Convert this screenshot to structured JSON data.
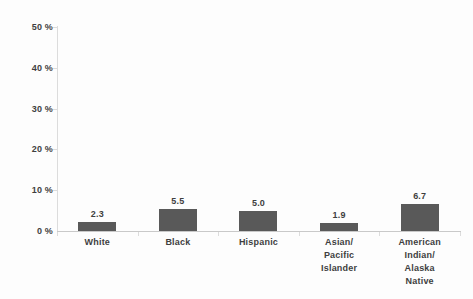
{
  "chart_data": {
    "type": "bar",
    "title": "",
    "subtitle": "",
    "xlabel": "",
    "ylabel": "",
    "categories": [
      "White",
      "Black",
      "Hispanic",
      "Asian/\nPacific\nIslander",
      "American\nIndian/\nAlaska\nNative"
    ],
    "values": [
      2.3,
      5.5,
      5.0,
      1.9,
      6.7
    ],
    "data_labels": [
      "2.3",
      "5.5",
      "5.0",
      "1.9",
      "6.7"
    ],
    "ylim": [
      0,
      50
    ],
    "ytick_values": [
      0,
      10,
      20,
      30,
      40,
      50
    ],
    "ytick_labels": [
      "0 %",
      "10 %",
      "20 %",
      "30 %",
      "40 %",
      "50 %"
    ],
    "grid": false,
    "legend": false,
    "bar_color": "#595959",
    "axis_color": "#dcdcdc",
    "text_color": "#3f3f3f"
  }
}
